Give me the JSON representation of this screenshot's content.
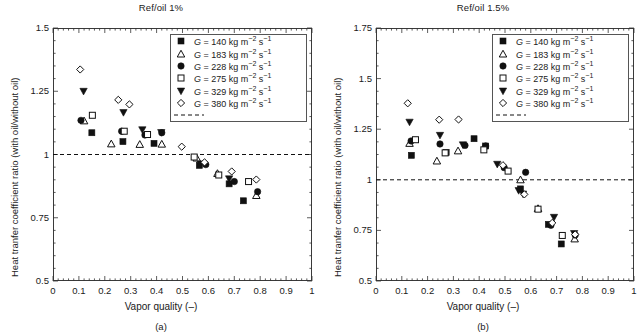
{
  "figure": {
    "xlabel": "Vapor quality (–)",
    "ylabel": "Heat tranfer coefficient ratio (with oil/without oil)",
    "series_marker_names": [
      "filled-square",
      "open-triangle",
      "filled-circle",
      "open-square",
      "filled-triangle-down",
      "open-diamond"
    ],
    "legend_dash_name": "reference-line-ratio-1"
  },
  "legend": {
    "entries": [
      {
        "symbol": "filled-square",
        "g": "140",
        "label": "G = 140 kg m−2 s−1"
      },
      {
        "symbol": "open-triangle",
        "g": "183",
        "label": "G = 183 kg m−2 s−1"
      },
      {
        "symbol": "filled-circle",
        "g": "228",
        "label": "G = 228 kg m−2 s−1"
      },
      {
        "symbol": "open-square",
        "g": "275",
        "label": "G = 275 kg m−2 s−1"
      },
      {
        "symbol": "filled-triangle-down",
        "g": "329",
        "label": "G = 329 kg m−2 s−1"
      },
      {
        "symbol": "open-diamond",
        "g": "380",
        "label": "G = 380 kg m−2 s−1"
      }
    ],
    "units_prefix": "kg m",
    "exp_mass": "−2",
    "unit_s": "s",
    "exp_time": "−1"
  },
  "chart_data": [
    {
      "id": "panel-a",
      "type": "scatter",
      "title": "Ref/oil 1%",
      "caption": "(a)",
      "xlabel": "Vapor quality (–)",
      "ylabel": "Heat tranfer coefficient ratio (with oil/without oil)",
      "xlim": [
        0,
        1
      ],
      "ylim": [
        0.5,
        1.5
      ],
      "xticks": [
        0,
        0.1,
        0.2,
        0.3,
        0.4,
        0.5,
        0.6,
        0.7,
        0.8,
        0.9,
        1
      ],
      "xticklabels": [
        "0",
        "0.1",
        "0.2",
        "0.3",
        "0.4",
        "0.5",
        "0.6",
        "0.7",
        "0.8",
        "0.9",
        "1"
      ],
      "yticks": [
        0.5,
        0.75,
        1,
        1.25,
        1.5
      ],
      "yticklabels": [
        "0.5",
        "0.75",
        "1",
        "1.25",
        "1.5"
      ],
      "xminor_step": 0.02,
      "yminor_step": 0.05,
      "grid": false,
      "legend_position": "upper right",
      "reference_line": {
        "y": 1.0,
        "style": "dashed"
      },
      "series": [
        {
          "name": "G = 140 kg m−2 s−1",
          "marker": "filled-square",
          "points": [
            [
              0.15,
              1.086
            ],
            [
              0.27,
              1.051
            ],
            [
              0.39,
              1.044
            ],
            [
              0.565,
              0.957
            ],
            [
              0.68,
              0.884
            ],
            [
              0.735,
              0.817
            ]
          ]
        },
        {
          "name": "G = 183 kg m−2 s−1",
          "marker": "open-triangle",
          "points": [
            [
              0.12,
              1.133
            ],
            [
              0.225,
              1.042
            ],
            [
              0.335,
              1.04
            ],
            [
              0.42,
              1.041
            ],
            [
              0.555,
              0.986
            ],
            [
              0.635,
              0.925
            ],
            [
              0.785,
              0.838
            ]
          ]
        },
        {
          "name": "G = 228 kg m−2 s−1",
          "marker": "filled-circle",
          "points": [
            [
              0.108,
              1.135
            ],
            [
              0.265,
              1.092
            ],
            [
              0.355,
              1.077
            ],
            [
              0.42,
              1.086
            ],
            [
              0.59,
              0.96
            ],
            [
              0.7,
              0.893
            ],
            [
              0.79,
              0.853
            ]
          ]
        },
        {
          "name": "G = 275 kg m−2 s−1",
          "marker": "open-square",
          "points": [
            [
              0.152,
              1.155
            ],
            [
              0.275,
              1.092
            ],
            [
              0.365,
              1.079
            ],
            [
              0.545,
              0.99
            ],
            [
              0.64,
              0.919
            ],
            [
              0.755,
              0.893
            ]
          ]
        },
        {
          "name": "G = 329 kg m−2 s−1",
          "marker": "filled-triangle-down",
          "points": [
            [
              0.118,
              1.25
            ],
            [
              0.272,
              1.166
            ],
            [
              0.345,
              1.098
            ],
            [
              0.418,
              1.087
            ],
            [
              0.57,
              0.963
            ],
            [
              0.68,
              0.904
            ]
          ]
        },
        {
          "name": "G = 380 kg m−2 s−1",
          "marker": "open-diamond",
          "points": [
            [
              0.105,
              1.336
            ],
            [
              0.252,
              1.216
            ],
            [
              0.295,
              1.198
            ],
            [
              0.497,
              1.031
            ],
            [
              0.585,
              0.969
            ],
            [
              0.69,
              0.933
            ],
            [
              0.785,
              0.901
            ]
          ]
        }
      ]
    },
    {
      "id": "panel-b",
      "type": "scatter",
      "title": "Ref/oil 1.5%",
      "caption": "(b)",
      "xlabel": "Vapor quality (–)",
      "ylabel": "Heat tranfer coefficient ratio (with oil/without oil)",
      "xlim": [
        0,
        1
      ],
      "ylim": [
        0.5,
        1.75
      ],
      "xticks": [
        0,
        0.1,
        0.2,
        0.3,
        0.4,
        0.5,
        0.6,
        0.7,
        0.8,
        0.9,
        1
      ],
      "xticklabels": [
        "0",
        "0.1",
        "0.2",
        "0.3",
        "0.4",
        "0.5",
        "0.6",
        "0.7",
        "0.8",
        "0.9",
        "1"
      ],
      "yticks": [
        0.5,
        0.75,
        1,
        1.25,
        1.5,
        1.75
      ],
      "yticklabels": [
        "0.5",
        "0.75",
        "1",
        "1.25",
        "1.5",
        "1.75"
      ],
      "xminor_step": 0.02,
      "yminor_step": 0.0625,
      "grid": false,
      "legend_position": "upper right",
      "reference_line": {
        "y": 1.0,
        "style": "dashed"
      },
      "series": [
        {
          "name": "G = 140 kg m−2 s−1",
          "marker": "filled-square",
          "points": [
            [
              0.137,
              1.121
            ],
            [
              0.272,
              1.135
            ],
            [
              0.38,
              1.203
            ],
            [
              0.425,
              1.167
            ],
            [
              0.56,
              0.955
            ],
            [
              0.668,
              0.78
            ],
            [
              0.718,
              0.683
            ]
          ]
        },
        {
          "name": "G = 183 kg m−2 s−1",
          "marker": "open-triangle",
          "points": [
            [
              0.13,
              1.18
            ],
            [
              0.236,
              1.093
            ],
            [
              0.318,
              1.143
            ],
            [
              0.56,
              1.0
            ],
            [
              0.628,
              0.858
            ],
            [
              0.77,
              0.708
            ]
          ]
        },
        {
          "name": "G = 228 kg m−2 s−1",
          "marker": "filled-circle",
          "points": [
            [
              0.136,
              1.192
            ],
            [
              0.248,
              1.177
            ],
            [
              0.345,
              1.17
            ],
            [
              0.425,
              1.167
            ],
            [
              0.497,
              1.06
            ],
            [
              0.58,
              1.037
            ],
            [
              0.678,
              0.775
            ],
            [
              0.772,
              0.727
            ]
          ]
        },
        {
          "name": "G = 275 kg m−2 s−1",
          "marker": "open-square",
          "points": [
            [
              0.153,
              1.198
            ],
            [
              0.268,
              1.133
            ],
            [
              0.418,
              1.148
            ],
            [
              0.512,
              1.043
            ],
            [
              0.628,
              0.855
            ],
            [
              0.722,
              0.725
            ]
          ]
        },
        {
          "name": "G = 329 kg m−2 s−1",
          "marker": "filled-triangle-down",
          "points": [
            [
              0.13,
              1.285
            ],
            [
              0.248,
              1.22
            ],
            [
              0.337,
              1.173
            ],
            [
              0.47,
              1.077
            ],
            [
              0.553,
              0.947
            ],
            [
              0.57,
              0.93
            ],
            [
              0.69,
              0.815
            ],
            [
              0.768,
              0.735
            ]
          ]
        },
        {
          "name": "G = 380 kg m−2 s−1",
          "marker": "open-diamond",
          "points": [
            [
              0.123,
              1.378
            ],
            [
              0.245,
              1.297
            ],
            [
              0.32,
              1.298
            ],
            [
              0.492,
              1.072
            ],
            [
              0.575,
              0.928
            ],
            [
              0.683,
              0.787
            ],
            [
              0.772,
              0.73
            ]
          ]
        }
      ]
    }
  ]
}
